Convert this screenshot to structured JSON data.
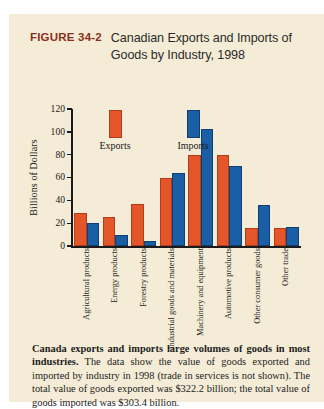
{
  "figure": {
    "label": "FIGURE 34-2",
    "title": "Canadian Exports and Imports of Goods by Industry, 1998",
    "caption_bold": "Canada exports and imports large volumes of goods in most industries.",
    "caption_rest": " The data show the value of goods exported and imported by industry in 1998 (trade in services is not shown). The total value of goods exported was $322.2 billion; the total value of goods imported was $303.4 billion."
  },
  "legend": {
    "exports_label": "Exports",
    "imports_label": "Imports"
  },
  "colors": {
    "exports": "#e4562a",
    "imports": "#1a5fa6",
    "panel_background": "#f4ecd6",
    "figure_label": "#8c2f20",
    "axis": "#1a1a1a"
  },
  "chart_data": {
    "type": "bar",
    "title": "Canadian Exports and Imports of Goods by Industry, 1998",
    "xlabel": "",
    "ylabel": "Billions of Dollars",
    "ylim": [
      0,
      120
    ],
    "yticks": [
      0,
      20,
      40,
      60,
      80,
      100,
      120
    ],
    "ytick_labels": [
      "0",
      "20",
      "40",
      "60",
      "80",
      "100",
      "120"
    ],
    "grid": false,
    "legend_position": "upper-left-inside",
    "categories": [
      "Agricultural products",
      "Energy products",
      "Forestry products",
      "Industrial goods and materials",
      "Machinery and equipment",
      "Automotive products",
      "Other consumer goods",
      "Other trade"
    ],
    "series": [
      {
        "name": "Exports",
        "color": "#e4562a",
        "values": [
          27,
          24,
          35,
          58,
          78,
          78,
          14,
          14
        ]
      },
      {
        "name": "Imports",
        "color": "#1a5fa6",
        "values": [
          18,
          8,
          3,
          62,
          101,
          68,
          34,
          15
        ]
      }
    ],
    "annotations": [
      "Total value of goods exported was $322.2 billion",
      "Total value of goods imported was $303.4 billion"
    ]
  }
}
